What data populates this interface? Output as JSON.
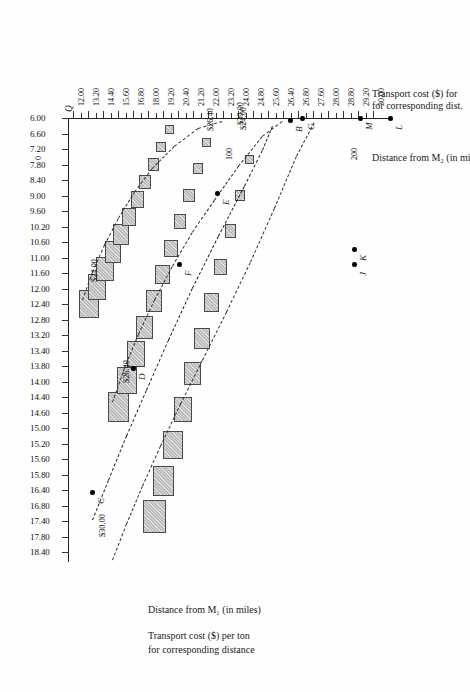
{
  "figure": {
    "orientation": "rotated-90-clockwise-page-scan",
    "top_caption_line1": "Transport cost ($) for",
    "top_caption_line2": "for corresponding dist.",
    "top_caption_distance": "Distance from M₂ (in mi",
    "bottom_caption_line1": "Distance from M₁ (in miles)",
    "bottom_caption_line2": "Transport cost ($) per ton",
    "bottom_caption_line3": "for corresponding distance",
    "origin_label": "Q"
  },
  "chart_data": {
    "type": "line",
    "xlabel": "Transport cost ($) per ton",
    "ylabel": "Distance from M₁ (in miles)",
    "ylabel2": "Distance from M₂ (in miles)",
    "cost_axis_ticks": [
      "12.00",
      "13.20",
      "14.40",
      "15.60",
      "16.80",
      "18.00",
      "19.20",
      "20.40",
      "21.20",
      "22.00",
      "23.20",
      "24.00",
      "24.80",
      "25.60",
      "26.40",
      "26.80",
      "27.60",
      "28.00",
      "28.80",
      "29.20",
      "30.00"
    ],
    "distance_axis_ticks": [
      "6.00",
      "6.60",
      "7.20",
      "7.80",
      "8.40",
      "9.00",
      "9.60",
      "10.20",
      "10.60",
      "11.00",
      "11.60",
      "12.00",
      "12.40",
      "12.80",
      "13.20",
      "13.40",
      "13.80",
      "14.00",
      "14.40",
      "14.60",
      "15.00",
      "15.20",
      "15.60",
      "15.80",
      "16.40",
      "16.80",
      "17.40",
      "17.80",
      "18.40"
    ],
    "distance_m2_ticks": [
      "0",
      "100",
      "200",
      "300"
    ],
    "distance_m1_ticks": [
      "0",
      "100",
      "200",
      "300"
    ],
    "annotations": [
      {
        "label": "$24.00",
        "series": "series-1"
      },
      {
        "label": "$24.00",
        "series": "series-1-lower"
      },
      {
        "label": "$26.40",
        "series": "series-2"
      },
      {
        "label": "$26.40",
        "series": "series-2-lower"
      },
      {
        "label": "$30.00",
        "series": "series-3"
      },
      {
        "label": "$30.00",
        "series": "series-3-lower"
      }
    ],
    "points": [
      {
        "name": "L",
        "cost": "30.00",
        "distance": "6.00"
      },
      {
        "name": "M",
        "cost": "29.20",
        "distance": "6.00"
      },
      {
        "name": "G",
        "cost": "26.80",
        "distance": "6.00"
      },
      {
        "name": "B",
        "cost": "26.40",
        "distance": "6.00"
      },
      {
        "name": "E",
        "cost": "24.00",
        "distance": "8.70"
      },
      {
        "name": "F",
        "cost": "21.20",
        "distance": "11.50"
      },
      {
        "name": "D",
        "cost": "18.00",
        "distance": "14.30"
      },
      {
        "name": "C",
        "cost": "14.40",
        "distance": "16.90"
      },
      {
        "name": "K",
        "cost": "29.00",
        "distance": "11.00"
      },
      {
        "name": "J",
        "cost": "29.00",
        "distance": "11.40"
      }
    ],
    "series": [
      {
        "name": "series-1",
        "label": "$24.00 step function",
        "step_count": 11
      },
      {
        "name": "series-2",
        "label": "$26.40 step function",
        "step_count": 11
      },
      {
        "name": "series-3",
        "label": "$30.00 step function",
        "step_count": 11
      }
    ],
    "grid": false,
    "legend": "none"
  }
}
